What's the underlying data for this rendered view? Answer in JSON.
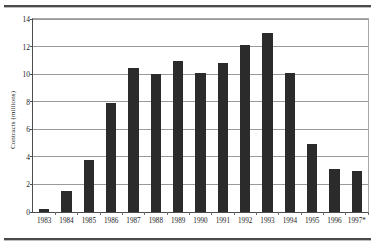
{
  "chart_data": {
    "type": "bar",
    "title": "",
    "xlabel": "",
    "ylabel": "Contracts (millions)",
    "ylim": [
      0,
      14
    ],
    "yticks": [
      0,
      2,
      4,
      6,
      8,
      10,
      12,
      14
    ],
    "ytick_labels": [
      "0",
      "2",
      "4",
      "6",
      "8",
      "10",
      "12",
      "14"
    ],
    "grid": true,
    "legend": "none",
    "bar_color": "#2b2b2b",
    "categories": [
      "1983",
      "1984",
      "1985",
      "1986",
      "1987",
      "1988",
      "1989",
      "1990",
      "1991",
      "1992",
      "1993",
      "1994",
      "1995",
      "1996",
      "1997*"
    ],
    "values": [
      0.2,
      1.5,
      3.75,
      7.9,
      10.45,
      10.0,
      10.95,
      10.05,
      10.8,
      12.1,
      13.0,
      10.1,
      4.9,
      3.1,
      3.0
    ],
    "note": "1997 value marked with asterisk"
  }
}
